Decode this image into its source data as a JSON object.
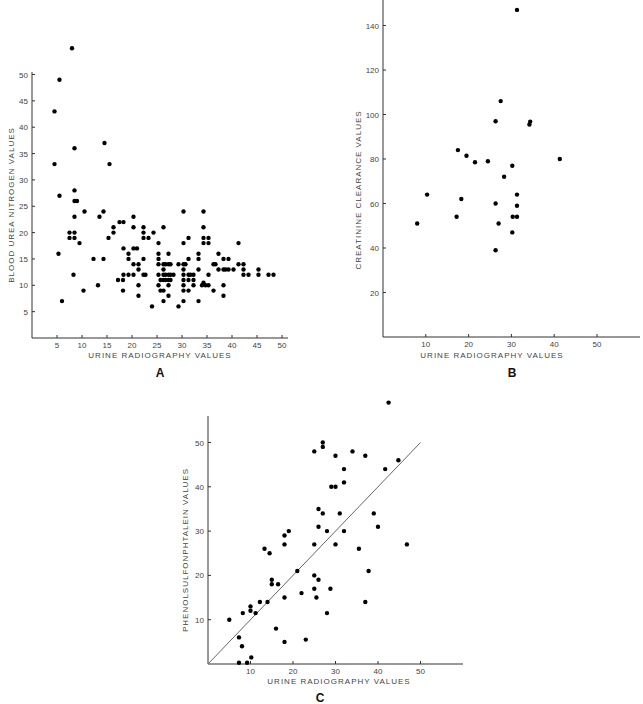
{
  "chart_data": [
    {
      "panel": "A",
      "type": "scatter",
      "title": "",
      "xlabel": "URINE RADIOGRAPHY VALUES",
      "ylabel": "BLOOD UREA NITROGEN VALUES",
      "xticks": [
        5,
        10,
        15,
        20,
        25,
        30,
        35,
        40,
        45,
        50
      ],
      "yticks": [
        5,
        10,
        15,
        20,
        25,
        30,
        35,
        40,
        45,
        50
      ],
      "xlim": [
        0,
        51
      ],
      "ylim": [
        0,
        55
      ],
      "grid": false,
      "frame": {
        "x0": 32,
        "y_base": 338,
        "x_unit": 5.0,
        "x_origin_val": 0,
        "y_unit": 5.27,
        "x_end": 288,
        "y_top": 72
      },
      "points": [
        [
          8,
          55
        ],
        [
          5.5,
          49
        ],
        [
          4.5,
          43
        ],
        [
          4.5,
          33
        ],
        [
          5.5,
          27
        ],
        [
          5.3,
          16
        ],
        [
          6,
          7
        ],
        [
          8.5,
          36
        ],
        [
          8.5,
          28
        ],
        [
          8.5,
          26
        ],
        [
          9,
          26
        ],
        [
          8.5,
          23
        ],
        [
          7.5,
          20
        ],
        [
          8.5,
          20
        ],
        [
          7.5,
          19
        ],
        [
          8.5,
          19
        ],
        [
          9.5,
          18
        ],
        [
          8.3,
          12
        ],
        [
          10.5,
          24
        ],
        [
          10.3,
          9
        ],
        [
          14.5,
          37
        ],
        [
          15.5,
          33
        ],
        [
          14.3,
          24
        ],
        [
          13.5,
          23
        ],
        [
          12.3,
          15
        ],
        [
          14.3,
          15
        ],
        [
          13.2,
          10
        ],
        [
          15.3,
          19
        ],
        [
          16.3,
          21
        ],
        [
          16.3,
          20
        ],
        [
          17.5,
          22
        ],
        [
          18.3,
          22
        ],
        [
          18.3,
          17
        ],
        [
          19.3,
          16
        ],
        [
          19.3,
          15
        ],
        [
          17.2,
          11
        ],
        [
          18.2,
          11
        ],
        [
          18.3,
          12
        ],
        [
          19.3,
          12
        ],
        [
          18.2,
          9
        ],
        [
          20.3,
          23
        ],
        [
          20.3,
          21
        ],
        [
          20.3,
          17
        ],
        [
          21,
          17
        ],
        [
          20.3,
          14
        ],
        [
          21.3,
          14
        ],
        [
          21.3,
          13
        ],
        [
          20.3,
          12
        ],
        [
          21.3,
          10
        ],
        [
          21.3,
          8
        ],
        [
          22.3,
          21
        ],
        [
          22.3,
          20
        ],
        [
          22.3,
          19
        ],
        [
          23.3,
          19
        ],
        [
          24.3,
          20
        ],
        [
          22.3,
          15
        ],
        [
          22.3,
          12
        ],
        [
          22.7,
          12
        ],
        [
          24,
          6
        ],
        [
          26.3,
          21
        ],
        [
          25.3,
          18
        ],
        [
          25.3,
          16
        ],
        [
          25.3,
          15
        ],
        [
          25.3,
          14
        ],
        [
          26.3,
          14
        ],
        [
          26.7,
          14
        ],
        [
          27.3,
          14
        ],
        [
          27.7,
          14
        ],
        [
          25.3,
          12
        ],
        [
          26.3,
          12
        ],
        [
          26.7,
          12
        ],
        [
          27.3,
          12
        ],
        [
          27.7,
          12
        ],
        [
          28.3,
          12
        ],
        [
          26.3,
          13
        ],
        [
          25.7,
          11
        ],
        [
          26.3,
          11
        ],
        [
          26.7,
          11
        ],
        [
          27.3,
          11
        ],
        [
          27.7,
          11
        ],
        [
          25.3,
          10
        ],
        [
          27.3,
          10
        ],
        [
          25.7,
          9
        ],
        [
          26.3,
          9
        ],
        [
          27.3,
          8
        ],
        [
          26.3,
          7
        ],
        [
          27.3,
          16
        ],
        [
          30.3,
          24
        ],
        [
          30.3,
          18
        ],
        [
          31.3,
          19
        ],
        [
          29.3,
          14
        ],
        [
          30.3,
          14
        ],
        [
          30.7,
          14
        ],
        [
          31.3,
          15
        ],
        [
          30.3,
          13
        ],
        [
          30.3,
          12
        ],
        [
          31.3,
          12
        ],
        [
          31.7,
          12
        ],
        [
          32.3,
          12
        ],
        [
          30.3,
          11
        ],
        [
          31.3,
          11
        ],
        [
          32.3,
          11
        ],
        [
          30.3,
          10
        ],
        [
          32.3,
          10
        ],
        [
          30.3,
          9
        ],
        [
          31.3,
          9
        ],
        [
          30.3,
          7
        ],
        [
          29.3,
          6
        ],
        [
          34.3,
          24
        ],
        [
          34.3,
          21
        ],
        [
          34.3,
          19
        ],
        [
          35.3,
          19
        ],
        [
          34.3,
          18
        ],
        [
          35.3,
          18
        ],
        [
          33.3,
          16
        ],
        [
          33.3,
          15
        ],
        [
          33.3,
          13
        ],
        [
          34.3,
          10.5
        ],
        [
          34,
          10
        ],
        [
          34.7,
          10
        ],
        [
          35.3,
          10
        ],
        [
          35.3,
          12
        ],
        [
          33.3,
          7
        ],
        [
          36.3,
          14
        ],
        [
          36.7,
          14
        ],
        [
          37.3,
          16
        ],
        [
          37.3,
          13
        ],
        [
          38.3,
          15
        ],
        [
          39.3,
          15
        ],
        [
          38.3,
          13
        ],
        [
          38.7,
          13
        ],
        [
          39.3,
          13
        ],
        [
          40.3,
          13
        ],
        [
          38.3,
          10
        ],
        [
          38.3,
          8
        ],
        [
          36.3,
          9
        ],
        [
          41.3,
          18
        ],
        [
          41.3,
          14
        ],
        [
          42.3,
          14
        ],
        [
          42.3,
          13
        ],
        [
          42.3,
          12
        ],
        [
          43.3,
          12
        ],
        [
          45.3,
          13
        ],
        [
          45.3,
          12
        ],
        [
          47.3,
          12
        ],
        [
          48.3,
          12
        ]
      ]
    },
    {
      "panel": "B",
      "type": "scatter",
      "title": "",
      "xlabel": "URINE RADIOGRAPHY VALUES",
      "ylabel": "CREATININE CLEARANCE VALUES",
      "xticks": [
        10,
        20,
        30,
        40,
        50
      ],
      "yticks": [
        20,
        40,
        60,
        80,
        100,
        120,
        140
      ],
      "xlim": [
        0,
        60
      ],
      "ylim": [
        0,
        150
      ],
      "grid": false,
      "frame": {
        "x0": 383,
        "y_base": 337,
        "x_unit": 4.28,
        "x_origin_val": 0,
        "y_unit": 2.225,
        "x_end": 640,
        "y_top": 0
      },
      "points": [
        [
          8,
          51
        ],
        [
          10.3,
          64
        ],
        [
          17.5,
          84
        ],
        [
          19.5,
          81.5
        ],
        [
          21.5,
          78.5
        ],
        [
          24.5,
          79
        ],
        [
          17.2,
          54
        ],
        [
          18.3,
          62
        ],
        [
          26.3,
          97
        ],
        [
          27.5,
          106
        ],
        [
          28.3,
          72
        ],
        [
          26.3,
          60
        ],
        [
          27,
          51
        ],
        [
          26.3,
          39
        ],
        [
          30.2,
          77
        ],
        [
          31.3,
          64
        ],
        [
          31.3,
          59
        ],
        [
          30.3,
          54
        ],
        [
          31.3,
          54
        ],
        [
          30.2,
          47
        ],
        [
          31.3,
          147
        ],
        [
          34.2,
          95.5
        ],
        [
          34.4,
          96.8
        ],
        [
          41.3,
          80
        ]
      ]
    },
    {
      "panel": "C",
      "type": "scatter",
      "title": "",
      "xlabel": "URINE RADIOGRAPHY VALUES",
      "ylabel": "PHENOLSULFONPHTALEIN VALUES",
      "xticks": [
        10,
        20,
        30,
        40,
        50
      ],
      "yticks": [
        10,
        20,
        30,
        40,
        50
      ],
      "xlim": [
        0,
        60
      ],
      "ylim": [
        0,
        56
      ],
      "grid": false,
      "fit_line": {
        "from": [
          0,
          0
        ],
        "to": [
          50,
          50
        ]
      },
      "frame": {
        "x0": 208,
        "y_base": 664,
        "x_unit": 4.25,
        "x_origin_val": 0,
        "y_unit": 4.43,
        "x_end": 463,
        "y_top": 416
      },
      "points": [
        [
          5,
          10
        ],
        [
          7.3,
          6
        ],
        [
          8,
          4
        ],
        [
          7.3,
          0.3
        ],
        [
          9.2,
          0.3
        ],
        [
          10.2,
          1.5
        ],
        [
          8.2,
          11.5
        ],
        [
          10,
          13
        ],
        [
          10,
          12
        ],
        [
          11.2,
          11.5
        ],
        [
          12.2,
          14
        ],
        [
          13.3,
          26
        ],
        [
          14.5,
          25
        ],
        [
          15,
          19
        ],
        [
          15,
          18
        ],
        [
          16.5,
          18
        ],
        [
          14,
          14
        ],
        [
          16,
          8
        ],
        [
          18,
          5
        ],
        [
          18,
          15
        ],
        [
          18,
          27
        ],
        [
          18,
          29
        ],
        [
          19,
          30
        ],
        [
          21,
          21
        ],
        [
          22,
          16
        ],
        [
          23,
          5.5
        ],
        [
          25,
          20
        ],
        [
          25,
          17
        ],
        [
          25.5,
          15
        ],
        [
          26,
          19
        ],
        [
          25,
          27
        ],
        [
          26,
          31
        ],
        [
          26,
          35
        ],
        [
          27,
          34
        ],
        [
          28,
          30
        ],
        [
          28,
          11.5
        ],
        [
          28.8,
          17
        ],
        [
          25,
          48
        ],
        [
          27,
          50
        ],
        [
          27,
          49
        ],
        [
          29,
          40
        ],
        [
          30,
          40
        ],
        [
          30,
          47
        ],
        [
          30,
          27
        ],
        [
          31,
          34
        ],
        [
          32,
          30
        ],
        [
          32,
          41
        ],
        [
          32,
          44
        ],
        [
          34,
          48
        ],
        [
          35.5,
          26
        ],
        [
          37,
          14
        ],
        [
          37.8,
          21
        ],
        [
          37,
          47
        ],
        [
          39,
          34
        ],
        [
          40,
          31
        ],
        [
          41.7,
          44
        ],
        [
          42.5,
          59
        ],
        [
          44.8,
          46
        ],
        [
          46.8,
          27
        ]
      ]
    }
  ],
  "panel_labels": {
    "a": "A",
    "b": "B",
    "c": "C"
  },
  "axis_labels": {
    "a_x": "URINE RADIOGRAPHY VALUES",
    "a_y": "BLOOD UREA NITROGEN VALUES",
    "b_x": "URINE RADIOGRAPHY VALUES",
    "b_y": "CREATININE CLEARANCE VALUES",
    "c_x": "URINE RADIOGRAPHY VALUES",
    "c_y": "PHENOLSULFONPHTALEIN VALUES"
  }
}
